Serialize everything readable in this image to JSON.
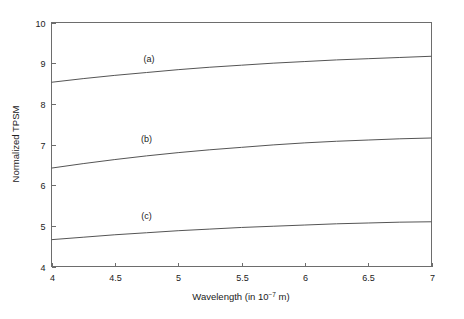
{
  "figure": {
    "background_color": "#ffffff",
    "frame_color": "#6d6d6d",
    "curve_color": "#555555"
  },
  "chart_data": {
    "type": "line",
    "title": "",
    "xlabel_parts": {
      "main": "Wavelength (in 10",
      "exponent": "−7",
      "tail": " m)"
    },
    "xlabel": "Wavelength (in 10−7 m)",
    "ylabel": "Normalized TPSM",
    "xlim": [
      4,
      7
    ],
    "ylim": [
      4,
      10
    ],
    "xticks": [
      4,
      4.5,
      5,
      5.5,
      6,
      6.5,
      7
    ],
    "xtick_labels": [
      "4",
      "4.5",
      "5",
      "5.5",
      "6",
      "6.5",
      "7"
    ],
    "yticks": [
      4,
      5,
      6,
      7,
      8,
      9,
      10
    ],
    "ytick_labels": [
      "4",
      "5",
      "6",
      "7",
      "8",
      "9",
      "10"
    ],
    "grid": false,
    "legend_position": "inline-annotations",
    "x": [
      4.0,
      4.25,
      4.5,
      4.75,
      5.0,
      5.25,
      5.5,
      5.75,
      6.0,
      6.25,
      6.5,
      6.75,
      7.0
    ],
    "series": [
      {
        "name": "(a)",
        "label": "(a)",
        "label_x": 4.77,
        "label_y": 9.02,
        "values": [
          8.53,
          8.62,
          8.7,
          8.77,
          8.84,
          8.9,
          8.95,
          9.0,
          9.04,
          9.08,
          9.11,
          9.14,
          9.17
        ]
      },
      {
        "name": "(b)",
        "label": "(b)",
        "label_x": 4.75,
        "label_y": 7.05,
        "values": [
          6.42,
          6.53,
          6.63,
          6.72,
          6.8,
          6.87,
          6.93,
          6.99,
          7.04,
          7.08,
          7.11,
          7.14,
          7.16
        ]
      },
      {
        "name": "(c)",
        "label": "(c)",
        "label_x": 4.75,
        "label_y": 5.17,
        "values": [
          4.66,
          4.72,
          4.78,
          4.83,
          4.88,
          4.92,
          4.96,
          4.99,
          5.02,
          5.05,
          5.07,
          5.09,
          5.1
        ]
      }
    ]
  }
}
